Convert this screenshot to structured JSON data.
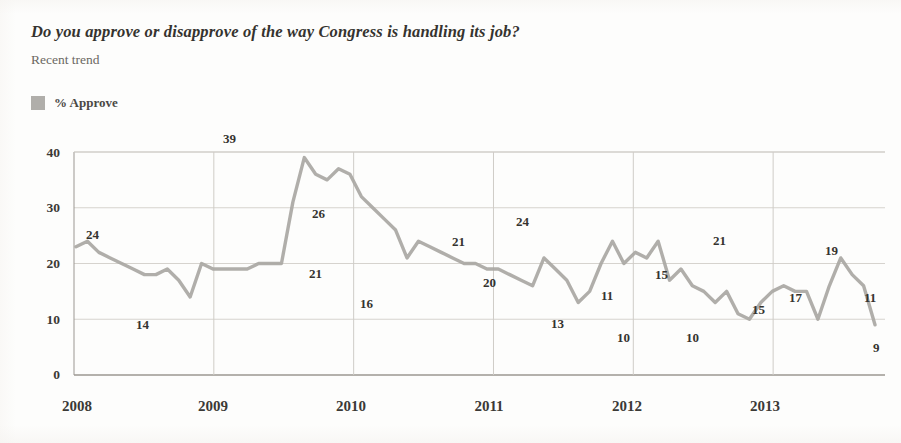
{
  "header": {
    "title": "Do you approve or disapprove of the way Congress is handling its job?",
    "subtitle": "Recent trend"
  },
  "legend": {
    "items": [
      {
        "label": "% Approve",
        "color": "#b0aeaa"
      }
    ]
  },
  "chart_data": {
    "type": "line",
    "title": "Do you approve or disapprove of the way Congress is handling its job?",
    "subtitle": "Recent trend",
    "xlabel": "",
    "ylabel": "",
    "ylim": [
      0,
      40
    ],
    "yticks": [
      0,
      10,
      20,
      30,
      40
    ],
    "xticks": [
      "2008",
      "2009",
      "2010",
      "2011",
      "2012",
      "2013"
    ],
    "grid": true,
    "legend_position": "top-left",
    "series": [
      {
        "name": "% Approve",
        "color": "#a9a7a3",
        "x": [
          "2008-01",
          "2008-02",
          "2008-03",
          "2008-04",
          "2008-05",
          "2008-06",
          "2008-07",
          "2008-08",
          "2008-09",
          "2008-10",
          "2008-11",
          "2008-12",
          "2009-01",
          "2009-02",
          "2009-03",
          "2009-04",
          "2009-05",
          "2009-06",
          "2009-07",
          "2009-08",
          "2009-09",
          "2009-10",
          "2009-11",
          "2009-12",
          "2010-01",
          "2010-02",
          "2010-03",
          "2010-04",
          "2010-05",
          "2010-06",
          "2010-07",
          "2010-08",
          "2010-09",
          "2010-10",
          "2010-11",
          "2010-12",
          "2011-01",
          "2011-02",
          "2011-03",
          "2011-04",
          "2011-05",
          "2011-06",
          "2011-07",
          "2011-08",
          "2011-09",
          "2011-10",
          "2011-11",
          "2011-12",
          "2012-01",
          "2012-02",
          "2012-03",
          "2012-04",
          "2012-05",
          "2012-06",
          "2012-07",
          "2012-08",
          "2012-09",
          "2012-10",
          "2012-11",
          "2012-12",
          "2013-01",
          "2013-02",
          "2013-03",
          "2013-04",
          "2013-05",
          "2013-06",
          "2013-07",
          "2013-08",
          "2013-09",
          "2013-10",
          "2013-11"
        ],
        "values": [
          23,
          24,
          22,
          21,
          20,
          19,
          18,
          18,
          19,
          17,
          14,
          20,
          19,
          19,
          19,
          19,
          20,
          20,
          20,
          31,
          39,
          36,
          35,
          37,
          36,
          32,
          30,
          28,
          26,
          21,
          24,
          23,
          22,
          21,
          20,
          20,
          19,
          19,
          18,
          17,
          16,
          21,
          19,
          17,
          13,
          15,
          20,
          24,
          20,
          22,
          21,
          24,
          17,
          19,
          16,
          15,
          13,
          15,
          11,
          10,
          13,
          15,
          16,
          15,
          15,
          10,
          16,
          21,
          18,
          16,
          9
        ]
      }
    ],
    "point_labels": [
      {
        "text": "24",
        "value": 24,
        "x_px": 86,
        "y_px": 227
      },
      {
        "text": "14",
        "value": 14,
        "x_px": 136,
        "y_px": 317
      },
      {
        "text": "39",
        "value": 39,
        "x_px": 223,
        "y_px": 131
      },
      {
        "text": "26",
        "value": 26,
        "x_px": 312,
        "y_px": 206
      },
      {
        "text": "21",
        "value": 21,
        "x_px": 309,
        "y_px": 266
      },
      {
        "text": "16",
        "value": 16,
        "x_px": 360,
        "y_px": 296
      },
      {
        "text": "21",
        "value": 21,
        "x_px": 452,
        "y_px": 234
      },
      {
        "text": "20",
        "value": 20,
        "x_px": 483,
        "y_px": 275
      },
      {
        "text": "24",
        "value": 24,
        "x_px": 516,
        "y_px": 214
      },
      {
        "text": "13",
        "value": 13,
        "x_px": 551,
        "y_px": 316
      },
      {
        "text": "11",
        "value": 11,
        "x_px": 601,
        "y_px": 288
      },
      {
        "text": "10",
        "value": 10,
        "x_px": 617,
        "y_px": 330
      },
      {
        "text": "15",
        "value": 15,
        "x_px": 655,
        "y_px": 267
      },
      {
        "text": "10",
        "value": 10,
        "x_px": 686,
        "y_px": 330
      },
      {
        "text": "21",
        "value": 21,
        "x_px": 713,
        "y_px": 233
      },
      {
        "text": "15",
        "value": 15,
        "x_px": 752,
        "y_px": 302
      },
      {
        "text": "17",
        "value": 17,
        "x_px": 789,
        "y_px": 290
      },
      {
        "text": "19",
        "value": 19,
        "x_px": 825,
        "y_px": 243
      },
      {
        "text": "11",
        "value": 11,
        "x_px": 864,
        "y_px": 290
      },
      {
        "text": "9",
        "value": 9,
        "x_px": 873,
        "y_px": 340
      }
    ]
  },
  "axes": {
    "y_labels": [
      {
        "text": "40",
        "y_px": 145
      },
      {
        "text": "30",
        "y_px": 200
      },
      {
        "text": "20",
        "y_px": 256
      },
      {
        "text": "10",
        "y_px": 312
      },
      {
        "text": "0",
        "y_px": 367
      }
    ],
    "x_labels": [
      {
        "text": "2008",
        "x_px": 42
      },
      {
        "text": "2009",
        "x_px": 178
      },
      {
        "text": "2010",
        "x_px": 316
      },
      {
        "text": "2011",
        "x_px": 454
      },
      {
        "text": "2012",
        "x_px": 592
      },
      {
        "text": "2013",
        "x_px": 730
      }
    ]
  }
}
